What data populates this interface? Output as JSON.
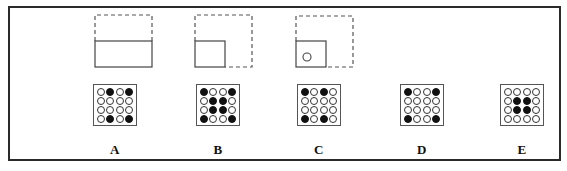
{
  "puzzle": {
    "type": "paper-folding-punch",
    "fold_steps": [
      {
        "id": 1,
        "description": "square folded in half horizontally (top half folded down)",
        "shape": "half"
      },
      {
        "id": 2,
        "description": "folded again into quarter (bottom-left)",
        "shape": "quarter"
      },
      {
        "id": 3,
        "description": "hole punched in folded quarter",
        "shape": "quarter-punched"
      }
    ],
    "options": [
      {
        "label": "A",
        "grid": [
          [
            0,
            1,
            0,
            1
          ],
          [
            0,
            0,
            0,
            0
          ],
          [
            0,
            0,
            0,
            0
          ],
          [
            0,
            1,
            0,
            1
          ]
        ]
      },
      {
        "label": "B",
        "grid": [
          [
            1,
            0,
            0,
            1
          ],
          [
            0,
            1,
            1,
            0
          ],
          [
            0,
            1,
            1,
            0
          ],
          [
            1,
            0,
            0,
            1
          ]
        ]
      },
      {
        "label": "C",
        "grid": [
          [
            1,
            0,
            1,
            0
          ],
          [
            0,
            0,
            0,
            0
          ],
          [
            0,
            0,
            0,
            0
          ],
          [
            1,
            0,
            1,
            0
          ]
        ]
      },
      {
        "label": "D",
        "grid": [
          [
            1,
            0,
            0,
            1
          ],
          [
            0,
            0,
            0,
            0
          ],
          [
            0,
            0,
            0,
            0
          ],
          [
            1,
            0,
            0,
            1
          ]
        ]
      },
      {
        "label": "E",
        "grid": [
          [
            0,
            0,
            0,
            0
          ],
          [
            0,
            1,
            1,
            0
          ],
          [
            0,
            1,
            1,
            0
          ],
          [
            0,
            0,
            0,
            0
          ]
        ]
      }
    ]
  },
  "colors": {
    "frame": "#2a2a2a",
    "dashed_line": "#555555",
    "solid_line": "#444444",
    "filled_dot": "#111111",
    "background": "#ffffff"
  }
}
